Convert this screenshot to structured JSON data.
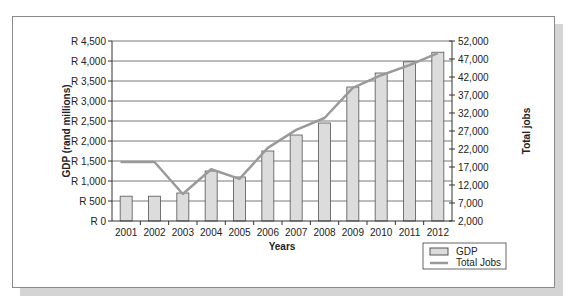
{
  "chart_data": {
    "type": "bar+line",
    "title": "",
    "categories": [
      "2001",
      "2002",
      "2003",
      "2004",
      "2005",
      "2006",
      "2007",
      "2008",
      "2009",
      "2010",
      "2011",
      "2012"
    ],
    "series": [
      {
        "name": "GDP",
        "type": "bar",
        "axis": "left",
        "values": [
          620,
          620,
          700,
          1250,
          1100,
          1750,
          2150,
          2450,
          3350,
          3700,
          3980,
          4220
        ]
      },
      {
        "name": "Total Jobs",
        "type": "line",
        "axis": "right",
        "values": [
          18400,
          18400,
          9500,
          16400,
          13700,
          22300,
          27300,
          30600,
          39000,
          42500,
          45300,
          48600
        ]
      }
    ],
    "xlabel": "Years",
    "ylabel": "GDP (rand millions)",
    "y2label": "Total jobs",
    "ylim": [
      0,
      4500
    ],
    "y2lim": [
      2000,
      52000
    ],
    "yticks": [
      "R 0",
      "R 500",
      "R 1,000",
      "R 1,500",
      "R 2,000",
      "R 2,500",
      "R 3,000",
      "R 3,500",
      "R 4,000",
      "R 4,500"
    ],
    "y2ticks": [
      "2,000",
      "7,000",
      "12,000",
      "17,000",
      "22,000",
      "27,000",
      "32,000",
      "37,000",
      "42,000",
      "47,000",
      "52,000"
    ],
    "grid": true,
    "legend_position": "bottom-right",
    "legend": [
      "GDP",
      "Total Jobs"
    ]
  },
  "colors": {
    "bar_fill": "#dcdcdc",
    "bar_stroke": "#555555",
    "line": "#9a9a9a",
    "grid": "#555555",
    "frame": "#8a8a8a",
    "shadow": "#d4d4d4"
  }
}
